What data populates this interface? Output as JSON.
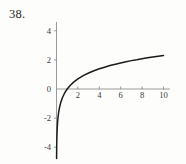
{
  "figure": {
    "number_label": "38.",
    "background_color": "#fdfdfc",
    "curve_color": "#1c1c1c",
    "axis_color": "#8e8e8e",
    "label_color": "#3a3a3a"
  },
  "chart_data": {
    "type": "line",
    "title": "",
    "subtitle": "",
    "xlabel": "",
    "ylabel": "",
    "function": "y = ln(x)",
    "xlim": [
      0,
      10.6
    ],
    "ylim": [
      -4.8,
      4.6
    ],
    "grid": false,
    "legend": null,
    "legend_position": "none",
    "x_ticks": [
      2,
      4,
      6,
      8,
      10
    ],
    "x_tick_labels": [
      "2",
      "4",
      "6",
      "8",
      "10"
    ],
    "y_ticks": [
      4,
      2,
      0,
      -2,
      -4
    ],
    "y_tick_labels": [
      "4",
      "2",
      "0",
      "-2",
      "-4"
    ],
    "x_axis_at_y": 0,
    "y_axis_at_x": 0,
    "x": [
      0.0085,
      0.012,
      0.018,
      0.025,
      0.035,
      0.05,
      0.07,
      0.1,
      0.14,
      0.2,
      0.28,
      0.4,
      0.55,
      0.75,
      1.0,
      1.3,
      1.6,
      2.0,
      2.5,
      3.0,
      3.5,
      4.0,
      4.5,
      5.0,
      5.5,
      6.0,
      6.5,
      7.0,
      7.5,
      8.0,
      8.5,
      9.0,
      9.5,
      10.0
    ],
    "y": [
      -4.77,
      -4.42,
      -4.02,
      -3.69,
      -3.35,
      -3.0,
      -2.66,
      -2.3,
      -1.97,
      -1.61,
      -1.27,
      -0.92,
      -0.6,
      -0.29,
      0.0,
      0.26,
      0.47,
      0.69,
      0.92,
      1.1,
      1.25,
      1.39,
      1.5,
      1.61,
      1.7,
      1.79,
      1.87,
      1.95,
      2.01,
      2.08,
      2.14,
      2.2,
      2.25,
      2.3
    ]
  }
}
